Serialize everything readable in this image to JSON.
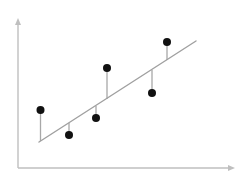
{
  "figure": {
    "background_color": "#ffffff",
    "width": 249,
    "height": 183
  },
  "axes": {
    "origin": {
      "x": 18,
      "y": 168
    },
    "y_axis": {
      "name": "vertical-axis",
      "from": {
        "x": 18,
        "y": 168
      },
      "to": {
        "x": 18,
        "y": 18
      },
      "color": "#bfbfbf",
      "stroke_width": 1.4,
      "arrow": "up",
      "label": ""
    },
    "x_axis": {
      "name": "horizontal-axis",
      "from": {
        "x": 18,
        "y": 168
      },
      "to": {
        "x": 235,
        "y": 168
      },
      "color": "#bfbfbf",
      "stroke_width": 1.4,
      "arrow": "right",
      "label": ""
    },
    "tick_labels": [],
    "grid": false
  },
  "chart_data": {
    "type": "scatter",
    "title": "",
    "subtitle": "",
    "xlabel": "",
    "ylabel": "",
    "xlim": [
      18,
      235
    ],
    "ylim": [
      18,
      168
    ],
    "grid": false,
    "legend": null,
    "legend_position": "none",
    "annotations": [],
    "point_color": "#111111",
    "point_radius": 4.0,
    "stem_color": "#a8a8a8",
    "stem_width": 1.3,
    "trend_line": {
      "name": "regression-line",
      "color": "#a0a0a0",
      "stroke_width": 1.4,
      "x1": 39,
      "y1": 142,
      "x2": 196,
      "y2": 41,
      "slope": -0.6433,
      "note": "screen coords; visually upward-sloping left to right"
    },
    "points": [
      {
        "id": "p1",
        "x": 40.5,
        "y": 110,
        "line_y": 141,
        "residual": 31,
        "side": "above"
      },
      {
        "id": "p2",
        "x": 69,
        "y": 135,
        "line_y": 123,
        "residual": -12,
        "side": "below"
      },
      {
        "id": "p3",
        "x": 96,
        "y": 118,
        "line_y": 106,
        "residual": -12,
        "side": "below"
      },
      {
        "id": "p4",
        "x": 107,
        "y": 68,
        "line_y": 99,
        "residual": 31,
        "side": "above"
      },
      {
        "id": "p5",
        "x": 152,
        "y": 93,
        "line_y": 70,
        "residual": -23,
        "side": "below"
      },
      {
        "id": "p6",
        "x": 167,
        "y": 42,
        "line_y": 60,
        "residual": 18,
        "side": "above"
      }
    ],
    "x": [
      40.5,
      69,
      96,
      107,
      152,
      167
    ],
    "values": [
      110,
      135,
      118,
      68,
      93,
      42
    ]
  }
}
